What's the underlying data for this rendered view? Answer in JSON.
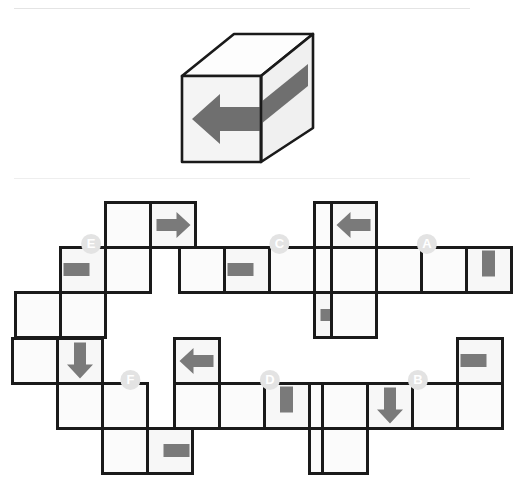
{
  "page": {
    "background_color": "#ffffff",
    "rule_color": "#e9e9e9"
  },
  "colors": {
    "arrow_gray": "#7a7a7a",
    "face_fill": "#f7f7f7",
    "face_fill_alt": "#fbfbfb",
    "face_stroke": "#1a1a1a",
    "badge_fill": "#e3e3e3",
    "badge_text": "#ffffff",
    "cube_top_fill": "#fdfdfd",
    "cube_front_fill": "#f4f4f4",
    "cube_side_fill": "#f0f0f0",
    "cube_stroke": "#1a1a1a"
  },
  "cube": {
    "name": "reference-cube",
    "description": "Isometric cube with a thick gray arrow pointing left across the front face and wrapping onto the right side face",
    "faces": [
      "top",
      "front",
      "right"
    ],
    "arrow": {
      "direction": "left",
      "color": "#7a7a7a",
      "spans_faces": [
        "front",
        "right"
      ]
    }
  },
  "options": [
    {
      "id": "E",
      "label": "E",
      "name": "option-e",
      "layout": "staircase-ascending",
      "cells": [
        {
          "col": 0,
          "row": 2,
          "mark": "none"
        },
        {
          "col": 1,
          "row": 2,
          "mark": "none"
        },
        {
          "col": 1,
          "row": 1,
          "mark": "bar-left"
        },
        {
          "col": 2,
          "row": 1,
          "mark": "none"
        },
        {
          "col": 2,
          "row": 0,
          "mark": "none"
        },
        {
          "col": 3,
          "row": 0,
          "mark": "arrow-right"
        }
      ],
      "badge": {
        "col": 1.18,
        "row": 0.42
      }
    },
    {
      "id": "C",
      "label": "C",
      "name": "option-c",
      "layout": "row4-up3-down3",
      "cells": [
        {
          "col": 0,
          "row": 1,
          "mark": "none"
        },
        {
          "col": 1,
          "row": 1,
          "mark": "bar-left"
        },
        {
          "col": 2,
          "row": 1,
          "mark": "none"
        },
        {
          "col": 3,
          "row": 1,
          "mark": "none"
        },
        {
          "col": 3,
          "row": 0,
          "mark": "none"
        },
        {
          "col": 3,
          "row": 2,
          "mark": "arrow-right"
        }
      ],
      "badge": {
        "col": 1.72,
        "row": 0.42
      }
    },
    {
      "id": "A",
      "label": "A",
      "name": "option-a",
      "layout": "row4-up0-down0",
      "cells": [
        {
          "col": 0,
          "row": 0,
          "mark": "arrow-left"
        },
        {
          "col": 0,
          "row": 1,
          "mark": "none"
        },
        {
          "col": 1,
          "row": 1,
          "mark": "none"
        },
        {
          "col": 2,
          "row": 1,
          "mark": "none"
        },
        {
          "col": 3,
          "row": 1,
          "mark": "bar-vertical"
        },
        {
          "col": 0,
          "row": 2,
          "mark": "none"
        }
      ],
      "badge": {
        "col": 1.62,
        "row": 0.42
      }
    },
    {
      "id": "F",
      "label": "F",
      "name": "option-f",
      "layout": "staircase-descending",
      "cells": [
        {
          "col": 0,
          "row": 0,
          "mark": "none"
        },
        {
          "col": 1,
          "row": 0,
          "mark": "arrow-down"
        },
        {
          "col": 1,
          "row": 1,
          "mark": "none"
        },
        {
          "col": 2,
          "row": 1,
          "mark": "none"
        },
        {
          "col": 2,
          "row": 2,
          "mark": "none"
        },
        {
          "col": 3,
          "row": 2,
          "mark": "bar-right"
        }
      ],
      "badge": {
        "col": 2.12,
        "row": 0.42
      }
    },
    {
      "id": "D",
      "label": "D",
      "name": "option-d",
      "layout": "row4-up0-down3",
      "cells": [
        {
          "col": 0,
          "row": 0,
          "mark": "arrow-left"
        },
        {
          "col": 0,
          "row": 1,
          "mark": "none"
        },
        {
          "col": 1,
          "row": 1,
          "mark": "none"
        },
        {
          "col": 2,
          "row": 1,
          "mark": "bar-vertical"
        },
        {
          "col": 3,
          "row": 1,
          "mark": "none"
        },
        {
          "col": 3,
          "row": 2,
          "mark": "none"
        }
      ],
      "badge": {
        "col": 1.62,
        "row": 0.42
      }
    },
    {
      "id": "B",
      "label": "B",
      "name": "option-b",
      "layout": "row4-up3-down0",
      "cells": [
        {
          "col": 3,
          "row": 0,
          "mark": "bar-left"
        },
        {
          "col": 0,
          "row": 1,
          "mark": "none"
        },
        {
          "col": 1,
          "row": 1,
          "mark": "arrow-down"
        },
        {
          "col": 2,
          "row": 1,
          "mark": "none"
        },
        {
          "col": 3,
          "row": 1,
          "mark": "none"
        },
        {
          "col": 0,
          "row": 2,
          "mark": "none"
        }
      ],
      "badge": {
        "col": 1.62,
        "row": 0.42
      }
    }
  ],
  "geometry": {
    "cell_size": 45,
    "stroke_width": 3,
    "positions": {
      "E": {
        "x": 13,
        "y": 200
      },
      "C": {
        "x": 177,
        "y": 200
      },
      "A": {
        "x": 329,
        "y": 200
      },
      "F": {
        "x": 10,
        "y": 336
      },
      "D": {
        "x": 172,
        "y": 336
      },
      "B": {
        "x": 320,
        "y": 336
      }
    }
  }
}
